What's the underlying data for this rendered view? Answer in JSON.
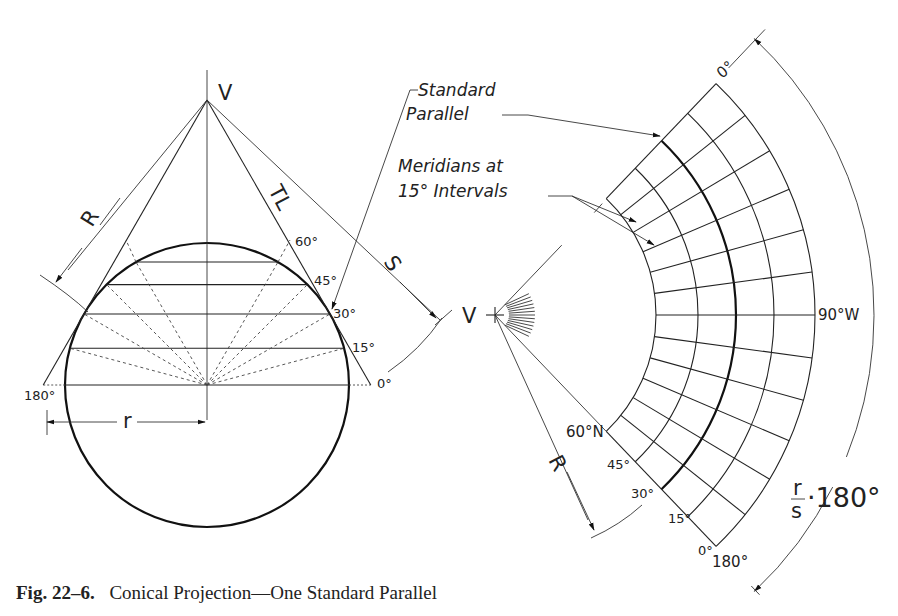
{
  "caption": {
    "figure_number": "Fig. 22–6.",
    "title": "Conical Projection—One Standard Parallel"
  },
  "left_view": {
    "apex_label": "V",
    "true_length_label": "TL",
    "slant_radius_label": "R",
    "arc_length_label": "S",
    "radius_label": "r",
    "latitude_labels": [
      "0°",
      "15°",
      "30°",
      "45°",
      "60°"
    ],
    "longitude_left_label": "180°",
    "geometry": {
      "apex": [
        207,
        100
      ],
      "sphere_center": [
        207,
        385
      ],
      "sphere_radius": 142,
      "standard_parallel_deg": 30,
      "parallels_deg": [
        0,
        15,
        30,
        45,
        60
      ]
    }
  },
  "right_view": {
    "apex_label": "V",
    "slant_radius_label": "R",
    "meridian_top_label": "0°",
    "meridian_mid_label": "90°W",
    "meridian_bottom_label": "180°",
    "latitude_labels": [
      "60°N",
      "45°",
      "30°",
      "15°",
      "0°"
    ],
    "angle_formula": {
      "numerator": "r",
      "denominator": "s",
      "rest": "·180°"
    },
    "geometry": {
      "apex": [
        495,
        315
      ],
      "half_angle_deg": 46.3,
      "meridian_count": 13,
      "arc_radii": [
        161,
        203,
        241,
        279,
        320
      ],
      "standard_parallel_index": 2,
      "dimension_arc_radius": 379
    }
  },
  "callouts": {
    "standard_parallel": [
      "Standard",
      "Parallel"
    ],
    "meridians": [
      "Meridians at",
      "15° Intervals"
    ]
  }
}
